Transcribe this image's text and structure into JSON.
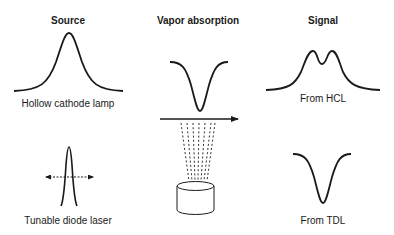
{
  "columns": {
    "source": {
      "heading": "Source"
    },
    "absorption": {
      "heading": "Vapor absorption"
    },
    "signal": {
      "heading": "Signal"
    }
  },
  "rows": {
    "hcl": {
      "source_label": "Hollow cathode lamp",
      "signal_label": "From HCL"
    },
    "tdl": {
      "source_label": "Tunable diode laser",
      "signal_label": "From TDL"
    }
  },
  "elements": {
    "source_hcl_curve": "broad-gaussian-emission-icon",
    "source_tdl_curve": "narrow-laser-line-icon",
    "tuning_arrow": "double-headed-dashed-arrow-icon",
    "absorption_curve": "absorption-dip-icon",
    "beam_arrow": "beam-arrow-icon",
    "vapor_plume": "vapor-plume-icon",
    "sample_cell": "cylinder-sample-cell-icon",
    "signal_hcl_curve": "self-reversed-doublet-icon",
    "signal_tdl_curve": "absorption-dip-signal-icon"
  },
  "colors": {
    "line": "#1a1a1a",
    "background": "#ffffff"
  }
}
